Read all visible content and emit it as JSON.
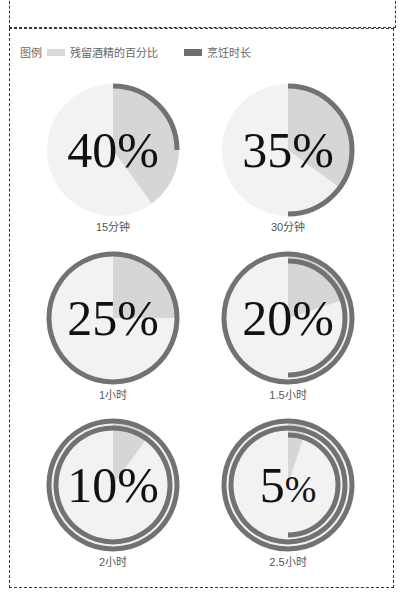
{
  "legend": {
    "title": "图例",
    "items": [
      {
        "label": "残留酒精的百分比",
        "color": "#d9d9d9"
      },
      {
        "label": "烹饪时长",
        "color": "#6e6e6e"
      }
    ]
  },
  "colors": {
    "base": "#f2f2f2",
    "slice": "#d6d6d6",
    "ring": "#727272"
  },
  "chart_data": {
    "type": "pie",
    "title": "",
    "legend": [
      "残留酒精的百分比",
      "烹饪时长"
    ],
    "categories": [
      "15分钟",
      "30分钟",
      "1小时",
      "1.5小时",
      "2小时",
      "2.5小时"
    ],
    "series": [
      {
        "name": "残留酒精的百分比",
        "values": [
          40,
          35,
          25,
          20,
          10,
          5
        ]
      },
      {
        "name": "烹饪时长 (小时)",
        "values": [
          0.25,
          0.5,
          1,
          1.5,
          2,
          2.5
        ]
      }
    ]
  },
  "panels": [
    {
      "pct": "40%",
      "num": "40",
      "label": "15分钟"
    },
    {
      "pct": "35%",
      "num": "35",
      "label": "30分钟"
    },
    {
      "pct": "25%",
      "num": "25",
      "label": "1小时"
    },
    {
      "pct": "20%",
      "num": "20",
      "label": "1.5小时"
    },
    {
      "pct": "10%",
      "num": "10",
      "label": "2小时"
    },
    {
      "pct": "5%",
      "num": "5",
      "label": "2.5小时"
    }
  ]
}
